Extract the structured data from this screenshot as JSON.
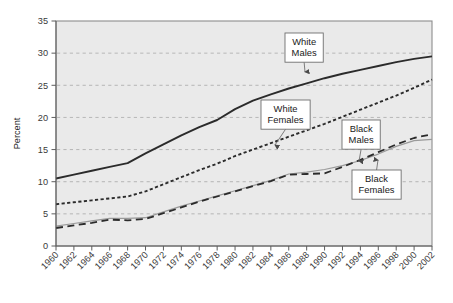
{
  "chart_data": {
    "type": "line",
    "title": "",
    "xlabel": "",
    "ylabel": "Percent",
    "ylim": [
      0,
      35
    ],
    "ytick_step": 5,
    "yticks": [
      "0",
      "5",
      "10",
      "15",
      "20",
      "25",
      "30",
      "35"
    ],
    "xlim": [
      1960,
      2002
    ],
    "grid": true,
    "legend_position": "inline-annotations",
    "plot_background": "#eaeaea",
    "categories": [
      1960,
      1962,
      1964,
      1966,
      1968,
      1970,
      1972,
      1974,
      1976,
      1978,
      1980,
      1982,
      1984,
      1986,
      1988,
      1990,
      1992,
      1994,
      1996,
      1998,
      2000,
      2002
    ],
    "xtick_labels": [
      "1960",
      "1962",
      "1964",
      "1966",
      "1968",
      "1970",
      "1972",
      "1974",
      "1976",
      "1978",
      "1980",
      "1982",
      "1984",
      "1986",
      "1988",
      "1990",
      "1992",
      "1994",
      "1996",
      "1998",
      "2000",
      "2002"
    ],
    "series": [
      {
        "name": "White Males",
        "style": "solid",
        "color": "#2b2b2b",
        "width": 1.9,
        "values": [
          10.5,
          11.1,
          11.7,
          12.3,
          12.9,
          14.4,
          15.8,
          17.2,
          18.5,
          19.6,
          21.3,
          22.6,
          23.6,
          24.5,
          25.3,
          26.1,
          26.8,
          27.4,
          28.0,
          28.6,
          29.1,
          29.5
        ]
      },
      {
        "name": "White Females",
        "style": "dotted",
        "color": "#2b2b2b",
        "width": 1.9,
        "values": [
          6.5,
          6.8,
          7.1,
          7.4,
          7.7,
          8.5,
          9.6,
          10.7,
          11.8,
          12.8,
          14.0,
          15.0,
          16.0,
          17.0,
          18.0,
          19.0,
          20.1,
          21.2,
          22.3,
          23.4,
          24.6,
          25.9
        ]
      },
      {
        "name": "Black Males",
        "style": "thin-solid",
        "color": "#9a9a9a",
        "width": 1.2,
        "values": [
          3.1,
          3.5,
          3.9,
          4.3,
          4.3,
          4.4,
          5.3,
          6.2,
          7.0,
          7.8,
          8.6,
          9.4,
          10.2,
          11.2,
          11.5,
          11.9,
          12.5,
          13.3,
          14.3,
          15.5,
          16.4,
          16.6
        ]
      },
      {
        "name": "Black Females",
        "style": "dashed",
        "color": "#2b2b2b",
        "width": 1.8,
        "values": [
          2.8,
          3.2,
          3.6,
          4.1,
          4.0,
          4.2,
          5.1,
          6.0,
          6.9,
          7.7,
          8.5,
          9.3,
          10.1,
          11.1,
          11.2,
          11.3,
          12.3,
          13.4,
          14.6,
          15.8,
          16.8,
          17.4
        ]
      }
    ],
    "annotations": [
      {
        "id": "white-males",
        "lines": [
          "White",
          "Males"
        ],
        "box_x": 285,
        "box_y": 33,
        "arrow_dir": "down",
        "target_x": 305,
        "target_y": 72
      },
      {
        "id": "white-females",
        "lines": [
          "White",
          "Females"
        ],
        "box_x": 261,
        "box_y": 100,
        "arrow_dir": "down",
        "target_x": 275,
        "target_y": 145
      },
      {
        "id": "black-males",
        "lines": [
          "Black",
          "Males"
        ],
        "box_x": 342,
        "box_y": 120,
        "arrow_dir": "down",
        "target_x": 359,
        "target_y": 161
      },
      {
        "id": "black-females",
        "lines": [
          "Black",
          "Females"
        ],
        "box_x": 352,
        "box_y": 170,
        "arrow_dir": "up",
        "target_x": 378,
        "target_y": 160
      }
    ]
  }
}
